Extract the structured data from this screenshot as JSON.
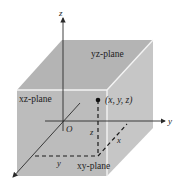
{
  "diagram": {
    "colors": {
      "background": "#ffffff",
      "top_face": "#b4b4b4",
      "front_face": "#bcbcbc",
      "side_face": "#c8c8c8",
      "edge": "#f4f4f4",
      "axis": "#2a2a2a",
      "text": "#222222"
    },
    "axes": {
      "z_label": "z",
      "y_label": "y",
      "origin_label": "O"
    },
    "planes": {
      "yz": "yz-plane",
      "xz": "xz-plane",
      "xy": "xy-plane"
    },
    "point": {
      "label": "(x, y, z)"
    },
    "projections": {
      "z_label": "z",
      "x_label": "x",
      "y_label": "y"
    }
  }
}
